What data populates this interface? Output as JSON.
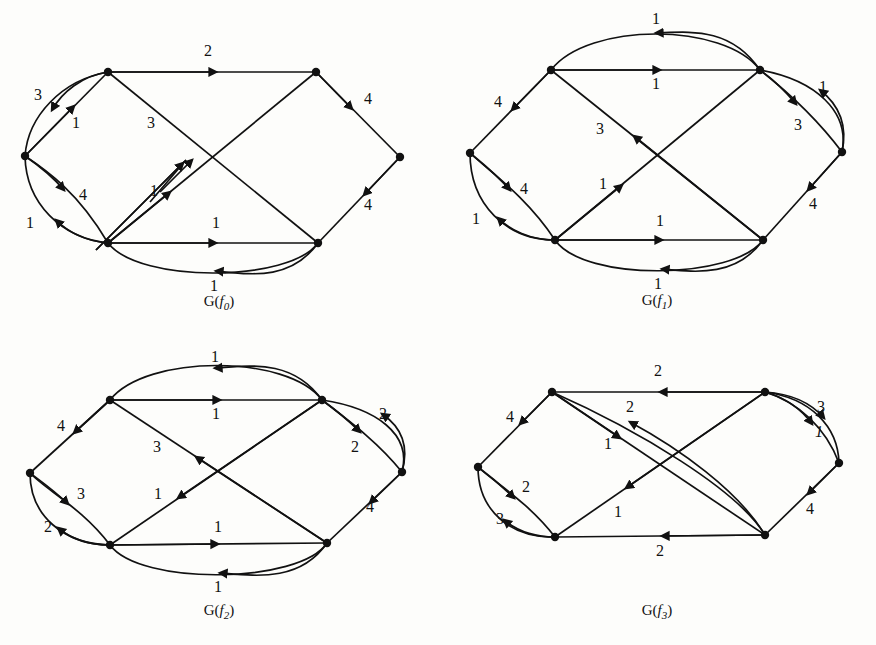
{
  "figure": {
    "title": "",
    "panel_count": 4,
    "background": "#fdfdfb",
    "ink": "#111111"
  },
  "panels": [
    {
      "id": "g-f0",
      "caption_g": "G(",
      "caption_f": "f",
      "caption_sub": "0",
      "caption_close": ")",
      "caption_full": "G(f0)",
      "origin": {
        "x": 0,
        "y": 0
      },
      "nodes": [
        {
          "name": "top-left",
          "x": 108,
          "y": 72
        },
        {
          "name": "top-right",
          "x": 316,
          "y": 72
        },
        {
          "name": "left",
          "x": 25,
          "y": 156
        },
        {
          "name": "right",
          "x": 400,
          "y": 157
        },
        {
          "name": "bottom-left",
          "x": 108,
          "y": 243
        },
        {
          "name": "bottom-right",
          "x": 318,
          "y": 243
        }
      ],
      "edges": [
        {
          "name": "top-left-to-top-right",
          "label": "2",
          "lx": 208,
          "ly": 52,
          "dir": "right"
        },
        {
          "name": "top-left-to-left-curved",
          "label": "3",
          "lx": 38,
          "ly": 96,
          "dir": "down-left"
        },
        {
          "name": "left-to-top-left",
          "label": "1",
          "lx": 76,
          "ly": 124,
          "dir": "up-right"
        },
        {
          "name": "left-to-bottom-left-curved",
          "label": "4",
          "lx": 83,
          "ly": 196,
          "dir": "down-right"
        },
        {
          "name": "bottom-left-to-left",
          "label": "1",
          "lx": 30,
          "ly": 224,
          "dir": "up-left"
        },
        {
          "name": "bottom-left-to-top-right-a",
          "label": "3",
          "lx": 151,
          "ly": 124,
          "dir": "up-right"
        },
        {
          "name": "bottom-left-to-top-right-b",
          "label": "1",
          "lx": 154,
          "ly": 192,
          "dir": "up-right"
        },
        {
          "name": "top-right-to-right",
          "label": "4",
          "lx": 368,
          "ly": 100,
          "dir": "down-right"
        },
        {
          "name": "right-to-bottom-right",
          "label": "4",
          "lx": 368,
          "ly": 206,
          "dir": "down-left"
        },
        {
          "name": "bottom-left-to-bottom-right",
          "label": "1",
          "lx": 216,
          "ly": 224,
          "dir": "right"
        },
        {
          "name": "bottom-right-to-bottom-left-curved",
          "label": "1",
          "lx": 214,
          "ly": 287,
          "dir": "left"
        }
      ],
      "caption_pos": {
        "x": 213,
        "y": 302
      }
    },
    {
      "id": "g-f1",
      "caption_g": "G(",
      "caption_f": "f",
      "caption_sub": "1",
      "caption_close": ")",
      "caption_full": "G(f1)",
      "origin": {
        "x": 438,
        "y": 0
      },
      "nodes": [
        {
          "name": "top-left",
          "x": 113,
          "y": 70
        },
        {
          "name": "top-right",
          "x": 322,
          "y": 70
        },
        {
          "name": "left",
          "x": 32,
          "y": 153
        },
        {
          "name": "right",
          "x": 404,
          "y": 152
        },
        {
          "name": "bottom-left",
          "x": 117,
          "y": 240
        },
        {
          "name": "bottom-right",
          "x": 325,
          "y": 240
        }
      ],
      "edges": [
        {
          "name": "top-right-to-top-left-curved",
          "label": "1",
          "lx": 218,
          "ly": 20,
          "dir": "left"
        },
        {
          "name": "top-left-to-top-right",
          "label": "1",
          "lx": 218,
          "ly": 85,
          "dir": "right"
        },
        {
          "name": "top-left-to-left",
          "label": "4",
          "lx": 60,
          "ly": 103,
          "dir": "down-left"
        },
        {
          "name": "left-to-bottom-left-curved",
          "label": "4",
          "lx": 86,
          "ly": 190,
          "dir": "down-right"
        },
        {
          "name": "bottom-left-to-left",
          "label": "1",
          "lx": 38,
          "ly": 220,
          "dir": "up-left"
        },
        {
          "name": "bottom-right-to-top-left",
          "label": "3",
          "lx": 162,
          "ly": 130,
          "dir": "up-left"
        },
        {
          "name": "bottom-left-to-top-right",
          "label": "1",
          "lx": 165,
          "ly": 185,
          "dir": "up-right"
        },
        {
          "name": "top-right-to-right",
          "label": "3",
          "lx": 360,
          "ly": 126,
          "dir": "down-right"
        },
        {
          "name": "right-to-top-right-curved",
          "label": "1",
          "lx": 385,
          "ly": 88,
          "dir": "up-left"
        },
        {
          "name": "right-to-bottom-right",
          "label": "4",
          "lx": 375,
          "ly": 205,
          "dir": "down-left"
        },
        {
          "name": "bottom-left-to-bottom-right",
          "label": "1",
          "lx": 222,
          "ly": 222,
          "dir": "right"
        },
        {
          "name": "bottom-right-to-bottom-left-curved",
          "label": "1",
          "lx": 220,
          "ly": 285,
          "dir": "left"
        }
      ],
      "caption_pos": {
        "x": 219,
        "y": 300
      }
    },
    {
      "id": "g-f2",
      "caption_g": "G(",
      "caption_f": "f",
      "caption_sub": "2",
      "caption_close": ")",
      "caption_full": "G(f2)",
      "origin": {
        "x": 0,
        "y": 330
      },
      "nodes": [
        {
          "name": "top-left",
          "x": 110,
          "y": 70
        },
        {
          "name": "top-right",
          "x": 322,
          "y": 70
        },
        {
          "name": "left",
          "x": 30,
          "y": 143
        },
        {
          "name": "right",
          "x": 402,
          "y": 142
        },
        {
          "name": "bottom-left",
          "x": 110,
          "y": 215
        },
        {
          "name": "bottom-right",
          "x": 327,
          "y": 213
        }
      ],
      "edges": [
        {
          "name": "top-right-to-top-left-curved",
          "label": "1",
          "lx": 215,
          "ly": 28,
          "dir": "left"
        },
        {
          "name": "top-left-to-top-right",
          "label": "1",
          "lx": 216,
          "ly": 85,
          "dir": "right"
        },
        {
          "name": "top-left-to-left",
          "label": "4",
          "lx": 61,
          "ly": 97,
          "dir": "down-left"
        },
        {
          "name": "left-to-bottom-left-curved",
          "label": "3",
          "lx": 81,
          "ly": 165,
          "dir": "down-right"
        },
        {
          "name": "bottom-left-to-left",
          "label": "2",
          "lx": 48,
          "ly": 198,
          "dir": "up-left"
        },
        {
          "name": "bottom-right-to-top-left",
          "label": "3",
          "lx": 157,
          "ly": 118,
          "dir": "up-left"
        },
        {
          "name": "top-right-to-bottom-left",
          "label": "1",
          "lx": 158,
          "ly": 165,
          "dir": "down-left"
        },
        {
          "name": "top-right-to-right",
          "label": "2",
          "lx": 355,
          "ly": 118,
          "dir": "down-right"
        },
        {
          "name": "right-to-top-right-curved",
          "label": "2",
          "lx": 383,
          "ly": 85,
          "dir": "up-left"
        },
        {
          "name": "right-to-bottom-right",
          "label": "4",
          "lx": 370,
          "ly": 178,
          "dir": "down-left"
        },
        {
          "name": "bottom-left-to-bottom-right",
          "label": "1",
          "lx": 218,
          "ly": 198,
          "dir": "right"
        },
        {
          "name": "bottom-right-to-bottom-left-curved",
          "label": "1",
          "lx": 218,
          "ly": 258,
          "dir": "left"
        }
      ],
      "caption_pos": {
        "x": 219,
        "y": 280
      }
    },
    {
      "id": "g-f3",
      "caption_g": "G(",
      "caption_f": "f",
      "caption_sub": "3",
      "caption_close": ")",
      "caption_full": "G(f3)",
      "origin": {
        "x": 438,
        "y": 330
      },
      "nodes": [
        {
          "name": "top-left",
          "x": 114,
          "y": 62
        },
        {
          "name": "top-right",
          "x": 327,
          "y": 62
        },
        {
          "name": "left",
          "x": 40,
          "y": 137
        },
        {
          "name": "right",
          "x": 401,
          "y": 133
        },
        {
          "name": "bottom-left",
          "x": 117,
          "y": 207
        },
        {
          "name": "bottom-right",
          "x": 327,
          "y": 205
        }
      ],
      "edges": [
        {
          "name": "top-right-to-top-left",
          "label": "2",
          "lx": 220,
          "ly": 42,
          "dir": "left"
        },
        {
          "name": "bottom-right-to-top-left-curved",
          "label": "2",
          "lx": 192,
          "ly": 78,
          "dir": "up-left"
        },
        {
          "name": "top-left-to-bottom-right",
          "label": "1",
          "lx": 170,
          "ly": 115,
          "dir": "down-right"
        },
        {
          "name": "top-left-to-left",
          "label": "4",
          "lx": 72,
          "ly": 88,
          "dir": "down-left"
        },
        {
          "name": "left-to-bottom-left-curved",
          "label": "2",
          "lx": 88,
          "ly": 158,
          "dir": "down-right"
        },
        {
          "name": "bottom-left-to-left",
          "label": "3",
          "lx": 62,
          "ly": 190,
          "dir": "up-left"
        },
        {
          "name": "top-right-to-bottom-left",
          "label": "1",
          "lx": 180,
          "ly": 183,
          "dir": "down-left"
        },
        {
          "name": "top-right-to-right-a",
          "label": "3",
          "lx": 383,
          "ly": 78,
          "dir": "down-right"
        },
        {
          "name": "top-right-to-right-b",
          "label": "1",
          "lx": 381,
          "ly": 103,
          "dir": "down-right"
        },
        {
          "name": "right-to-bottom-right",
          "label": "4",
          "lx": 372,
          "ly": 180,
          "dir": "down-left"
        },
        {
          "name": "bottom-right-to-bottom-left",
          "label": "2",
          "lx": 222,
          "ly": 222,
          "dir": "left"
        }
      ],
      "caption_pos": {
        "x": 222,
        "y": 280
      }
    }
  ]
}
